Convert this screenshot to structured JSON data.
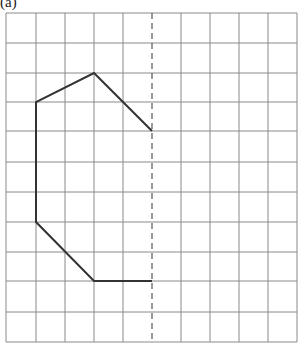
{
  "label": "(a)",
  "grid": {
    "cols": 10,
    "rows": 11,
    "x0": 6,
    "y0": 13,
    "x_lines": [
      6,
      36,
      65,
      94,
      123,
      152,
      181,
      210,
      239,
      268,
      297
    ],
    "y_lines": [
      13,
      43,
      73,
      102,
      131,
      162,
      192,
      222,
      252,
      281,
      312,
      342
    ],
    "line_color": "#8a8a8a"
  },
  "mirror_line": {
    "x": 152,
    "y1": 13,
    "y2": 342,
    "style": "dashed",
    "color": "#555555"
  },
  "shape": {
    "color": "#333333",
    "points_grid": [
      [
        5,
        4
      ],
      [
        3,
        2
      ],
      [
        1,
        3
      ],
      [
        1,
        7
      ],
      [
        3,
        9
      ],
      [
        5,
        9
      ]
    ],
    "points_px": [
      [
        152,
        131
      ],
      [
        94,
        73
      ],
      [
        36,
        102
      ],
      [
        36,
        222
      ],
      [
        94,
        281
      ],
      [
        152,
        281
      ]
    ]
  }
}
